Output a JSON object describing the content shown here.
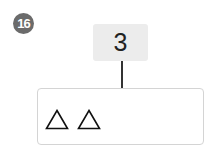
{
  "problem_number": "16",
  "number_box": {
    "value": "3"
  },
  "shape_box": {
    "shapes": [
      {
        "icon": "triangle-outline-icon",
        "glyph": "△"
      },
      {
        "icon": "triangle-outline-icon",
        "glyph": "△"
      }
    ]
  }
}
